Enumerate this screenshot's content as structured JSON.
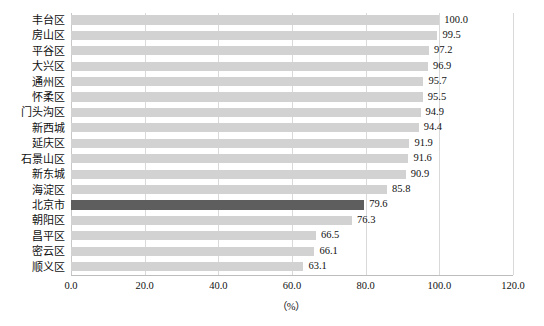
{
  "chart_data": {
    "type": "bar",
    "orientation": "horizontal",
    "title": "",
    "subtitle": "",
    "xlabel": "（%）",
    "ylabel": "",
    "xlim": [
      0.0,
      120.0
    ],
    "xticks": [
      "0.0",
      "20.0",
      "40.0",
      "60.0",
      "80.0",
      "100.0",
      "120.0"
    ],
    "xtick_values": [
      0.0,
      20.0,
      40.0,
      60.0,
      80.0,
      100.0,
      120.0
    ],
    "grid": "vertical",
    "legend": "none",
    "categories": [
      "丰台区",
      "房山区",
      "平谷区",
      "大兴区",
      "通州区",
      "怀柔区",
      "门头沟区",
      "新西城",
      "延庆区",
      "石景山区",
      "新东城",
      "海淀区",
      "北京市",
      "朝阳区",
      "昌平区",
      "密云区",
      "顺义区"
    ],
    "values": [
      100.0,
      99.5,
      97.2,
      96.9,
      95.7,
      95.5,
      94.9,
      94.4,
      91.9,
      91.6,
      90.9,
      85.8,
      79.6,
      76.3,
      66.5,
      66.1,
      63.1
    ],
    "value_labels": [
      "100.0",
      "99.5",
      "97.2",
      "96.9",
      "95.7",
      "95.5",
      "94.9",
      "94.4",
      "91.9",
      "91.6",
      "90.9",
      "85.8",
      "79.6",
      "76.3",
      "66.5",
      "66.1",
      "63.1"
    ],
    "highlight_index": 12,
    "highlight_category": "北京市",
    "colors": {
      "bar": "#d2d2d2",
      "bar_highlight": "#5e5e5e",
      "gridline": "#d9d9d9",
      "axis": "#bdbdbd",
      "text": "#111111",
      "background": "#ffffff"
    }
  }
}
